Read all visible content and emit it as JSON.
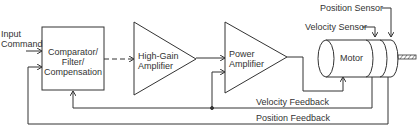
{
  "diagram": {
    "type": "block-diagram",
    "inputs": {
      "input_label_line1": "Input",
      "input_label_line2": "Command"
    },
    "blocks": {
      "comparator": {
        "line1": "Comparator/",
        "line2": "Filter/",
        "line3": "Compensation"
      },
      "high_gain_amp": {
        "line1": "High-Gain",
        "line2": "Amplifier"
      },
      "power_amp": {
        "line1": "Power",
        "line2": "Amplifier"
      },
      "motor": {
        "label": "Motor"
      }
    },
    "sensors": {
      "velocity_sensor": "Velocity Sensor",
      "position_sensor": "Position Sensor"
    },
    "feedback": {
      "velocity_feedback": "Velocity Feedback",
      "position_feedback": "Position Feedback"
    },
    "colors": {
      "line": "#333333",
      "background": "#ffffff"
    }
  }
}
